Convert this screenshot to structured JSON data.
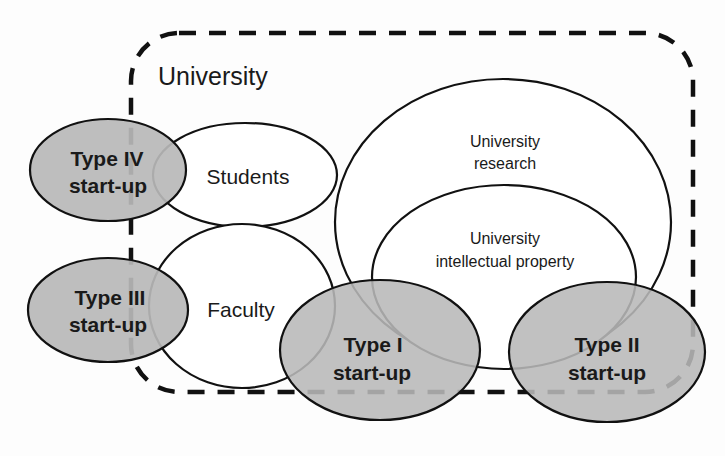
{
  "diagram": {
    "container": {
      "label": "University",
      "style": "dashed rounded rectangle"
    },
    "nodes": [
      {
        "id": "students",
        "label": [
          "Students"
        ],
        "fill": "#ffffff"
      },
      {
        "id": "faculty",
        "label": [
          "Faculty"
        ],
        "fill": "#ffffff"
      },
      {
        "id": "research",
        "label": [
          "University",
          "research"
        ],
        "fill": "#ffffff"
      },
      {
        "id": "ip",
        "label": [
          "University",
          "intellectual property"
        ],
        "fill": "#ffffff"
      },
      {
        "id": "type1",
        "label": [
          "Type I",
          "start-up"
        ],
        "fill": "#b8b8b8"
      },
      {
        "id": "type2",
        "label": [
          "Type II",
          "start-up"
        ],
        "fill": "#b8b8b8"
      },
      {
        "id": "type3",
        "label": [
          "Type III",
          "start-up"
        ],
        "fill": "#b8b8b8"
      },
      {
        "id": "type4",
        "label": [
          "Type IV",
          "start-up"
        ],
        "fill": "#b8b8b8"
      }
    ],
    "colors": {
      "stroke": "#111111",
      "startup_fill": "#b8b8b8",
      "background": "#fdfdfd"
    }
  }
}
